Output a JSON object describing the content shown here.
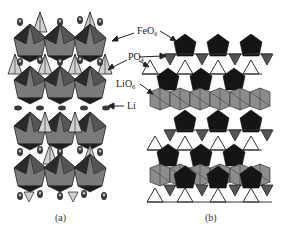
{
  "figure": {
    "panels": [
      {
        "id": "a",
        "caption": "(a)"
      },
      {
        "id": "b",
        "caption": "(b)"
      }
    ],
    "labels": [
      {
        "base": "FeO",
        "sub": "6"
      },
      {
        "base": "PO",
        "sub": "4"
      },
      {
        "base": "LiO",
        "sub": "6"
      },
      {
        "base": "Li",
        "sub": ""
      }
    ],
    "colors": {
      "feo6_dark": "#1a1a1a",
      "feo6_mid": "#6e6e6e",
      "po4_light": "#c8c8c8",
      "lio6_gray": "#8c8c8c",
      "li_atom": "#3a3a3a",
      "outline": "#222222",
      "background": "#ffffff"
    }
  }
}
